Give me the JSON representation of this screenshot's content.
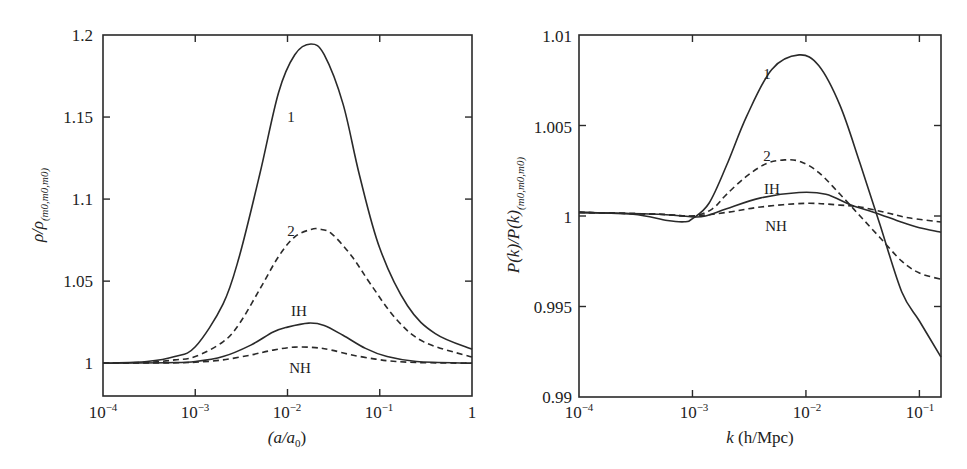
{
  "chart_data": [
    {
      "type": "line",
      "title": "",
      "xlabel": "(a/a0)",
      "ylabel": "ρ/ρ(m0,m0,m0)",
      "xscale": "log",
      "xlim": [
        0.0001,
        1
      ],
      "ylim": [
        0.98,
        1.2
      ],
      "grid": false,
      "legend": "inline labels",
      "x_ticks": [
        "10^-4",
        "10^-3",
        "10^-2",
        "10^-1",
        "1"
      ],
      "y_ticks": [
        "1",
        "1.05",
        "1.1",
        "1.15",
        "1.2"
      ],
      "series": [
        {
          "name": "1",
          "style": "solid",
          "x": [
            0.0001,
            0.0003,
            0.0006,
            0.001,
            0.002,
            0.003,
            0.005,
            0.008,
            0.012,
            0.018,
            0.025,
            0.04,
            0.06,
            0.1,
            0.2,
            0.4,
            1
          ],
          "y": [
            1.0,
            1.001,
            1.004,
            1.01,
            1.036,
            1.065,
            1.115,
            1.165,
            1.188,
            1.1945,
            1.188,
            1.158,
            1.115,
            1.07,
            1.035,
            1.018,
            1.0085
          ]
        },
        {
          "name": "2",
          "style": "dashed",
          "x": [
            0.0001,
            0.0003,
            0.0006,
            0.001,
            0.002,
            0.003,
            0.005,
            0.008,
            0.012,
            0.018,
            0.022,
            0.03,
            0.05,
            0.08,
            0.15,
            0.3,
            1
          ],
          "y": [
            1.0,
            1.0005,
            1.002,
            1.004,
            1.013,
            1.024,
            1.045,
            1.065,
            1.077,
            1.0815,
            1.0817,
            1.079,
            1.065,
            1.048,
            1.027,
            1.013,
            1.0037
          ]
        },
        {
          "name": "IH",
          "style": "solid",
          "x": [
            0.0001,
            0.0005,
            0.001,
            0.002,
            0.004,
            0.007,
            0.01,
            0.017,
            0.025,
            0.04,
            0.07,
            0.12,
            0.25,
            1
          ],
          "y": [
            1.0,
            1.0003,
            1.001,
            1.004,
            1.011,
            1.019,
            1.022,
            1.0244,
            1.023,
            1.017,
            1.009,
            1.004,
            1.001,
            1.0
          ]
        },
        {
          "name": "NH",
          "style": "dashed",
          "x": [
            0.0001,
            0.0005,
            0.001,
            0.002,
            0.004,
            0.007,
            0.012,
            0.02,
            0.03,
            0.05,
            0.09,
            0.15,
            0.3,
            1
          ],
          "y": [
            1.0,
            1.0002,
            1.0006,
            1.002,
            1.005,
            1.008,
            1.0098,
            1.0095,
            1.008,
            1.005,
            1.0025,
            1.001,
            1.0003,
            1.0
          ]
        }
      ],
      "annotations": [
        {
          "text": "1",
          "x": 0.0125,
          "y": 1.155
        },
        {
          "text": "2",
          "x": 0.0125,
          "y": 1.08
        },
        {
          "text": "IH",
          "x": 0.0135,
          "y": 1.032
        },
        {
          "text": "NH",
          "x": 0.0135,
          "y": 0.998
        }
      ]
    },
    {
      "type": "line",
      "title": "",
      "xlabel": "k (h/Mpc)",
      "ylabel": "P(k)/P(k)(m0,m0,m0)",
      "xscale": "log",
      "xlim": [
        0.0001,
        0.155
      ],
      "ylim": [
        0.99,
        1.01
      ],
      "grid": false,
      "legend": "inline labels",
      "x_ticks": [
        "10^-4",
        "10^-3",
        "10^-2",
        "10^-1"
      ],
      "y_ticks": [
        "0.99",
        "0.995",
        "1",
        "1.005",
        "1.01"
      ],
      "series": [
        {
          "name": "1",
          "style": "solid",
          "x": [
            0.0001,
            0.0003,
            0.0006,
            0.00085,
            0.001,
            0.0014,
            0.002,
            0.003,
            0.005,
            0.0087,
            0.013,
            0.02,
            0.03,
            0.045,
            0.07,
            0.1,
            0.155
          ],
          "y": [
            1.0002,
            1.0001,
            0.99975,
            0.99968,
            0.99985,
            1.0007,
            1.0028,
            1.0055,
            1.0081,
            1.0089,
            1.0083,
            1.0061,
            1.0029,
            0.9995,
            0.9958,
            0.9942,
            0.9922
          ]
        },
        {
          "name": "2",
          "style": "dashed",
          "x": [
            0.0001,
            0.0005,
            0.001,
            0.0015,
            0.002,
            0.003,
            0.0045,
            0.0065,
            0.009,
            0.013,
            0.02,
            0.03,
            0.045,
            0.07,
            0.1,
            0.155
          ],
          "y": [
            1.0002,
            1.0001,
            1.0,
            1.0004,
            1.0012,
            1.0022,
            1.0029,
            1.0031,
            1.003,
            1.0024,
            1.0012,
            1.0,
            0.9988,
            0.9975,
            0.99685,
            0.9965
          ]
        },
        {
          "name": "IH",
          "style": "solid",
          "x": [
            0.0001,
            0.0005,
            0.001,
            0.0013,
            0.002,
            0.004,
            0.0087,
            0.015,
            0.025,
            0.04,
            0.07,
            0.1,
            0.155
          ],
          "y": [
            1.0002,
            1.0001,
            0.99995,
            1.0,
            1.0004,
            1.001,
            1.0013,
            1.0012,
            1.0006,
            1.0002,
            0.99965,
            0.99935,
            0.9991
          ]
        },
        {
          "name": "NH",
          "style": "dashed",
          "x": [
            0.0001,
            0.0005,
            0.001,
            0.002,
            0.004,
            0.01,
            0.02,
            0.03,
            0.05,
            0.08,
            0.155
          ],
          "y": [
            1.0002,
            1.0001,
            1.0,
            1.0002,
            1.0005,
            1.0007,
            1.0006,
            1.0005,
            1.0002,
            0.9999,
            0.99967
          ]
        }
      ],
      "annotations": [
        {
          "text": "1",
          "x": 0.0055,
          "y": 1.0078
        },
        {
          "text": "2",
          "x": 0.0055,
          "y": 1.0032
        },
        {
          "text": "IH",
          "x": 0.0058,
          "y": 1.0014
        },
        {
          "text": "NH",
          "x": 0.006,
          "y": 0.9994
        }
      ]
    }
  ],
  "left_chart": {
    "xlabel_main": "(a/a",
    "xlabel_sub": "0",
    "xlabel_close": ")",
    "ylabel_main": "ρ/ρ",
    "ylabel_sub": "(m0,m0,m0)",
    "xticks": [
      {
        "base": "10",
        "exp": "−4"
      },
      {
        "base": "10",
        "exp": "−3"
      },
      {
        "base": "10",
        "exp": "−2"
      },
      {
        "base": "10",
        "exp": "−1"
      },
      {
        "base": "1",
        "exp": ""
      }
    ],
    "yticks": [
      "1",
      "1.05",
      "1.1",
      "1.15",
      "1.2"
    ],
    "labels": [
      "1",
      "2",
      "IH",
      "NH"
    ]
  },
  "right_chart": {
    "xlabel_k": "k",
    "xlabel_rest": " (h/Mpc)",
    "ylabel_main": "P(k)/P(k)",
    "ylabel_sub": "(m0,m0,m0)",
    "xticks": [
      {
        "base": "10",
        "exp": "−4"
      },
      {
        "base": "10",
        "exp": "−3"
      },
      {
        "base": "10",
        "exp": "−2"
      },
      {
        "base": "10",
        "exp": "−1"
      }
    ],
    "yticks": [
      "0.99",
      "0.995",
      "1",
      "1.005",
      "1.01"
    ],
    "labels": [
      "1",
      "2",
      "IH",
      "NH"
    ]
  }
}
